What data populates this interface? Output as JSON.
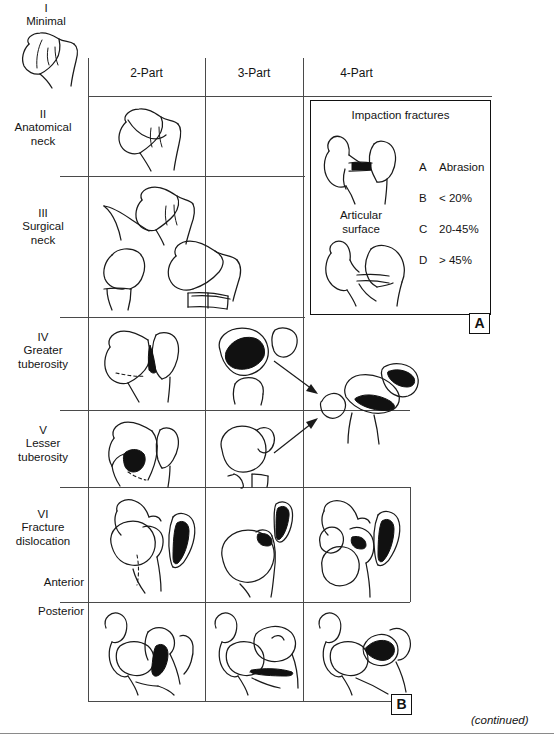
{
  "figure": {
    "caption_continued": "(continued)",
    "panel_a_label": "A",
    "panel_b_label": "B"
  },
  "columns": [
    {
      "label": "2-Part"
    },
    {
      "label": "3-Part"
    },
    {
      "label": "4-Part"
    }
  ],
  "rows": [
    {
      "numeral": "I",
      "name": "Minimal"
    },
    {
      "numeral": "II",
      "name": "Anatomical\nneck"
    },
    {
      "numeral": "III",
      "name": "Surgical\nneck"
    },
    {
      "numeral": "IV",
      "name": "Greater\ntuberosity"
    },
    {
      "numeral": "V",
      "name": "Lesser\ntuberosity"
    },
    {
      "numeral": "VI",
      "name": "Fracture\ndislocation"
    }
  ],
  "dislocation_directions": [
    {
      "label": "Anterior"
    },
    {
      "label": "Posterior"
    }
  ],
  "inset": {
    "title": "Impaction fractures",
    "articular_label": "Articular\nsurface",
    "legend": [
      {
        "key": "A",
        "value": "Abrasion"
      },
      {
        "key": "B",
        "value": "< 20%"
      },
      {
        "key": "C",
        "value": "20-45%"
      },
      {
        "key": "D",
        "value": "> 45%"
      }
    ]
  },
  "colors": {
    "ink": "#1a1a1a",
    "grid": "#4a4a4a",
    "paper": "#ffffff",
    "fill_black": "#111111"
  }
}
